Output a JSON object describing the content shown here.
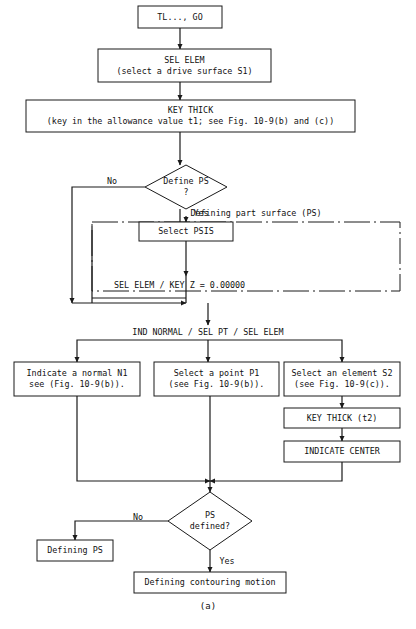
{
  "figure": {
    "caption": "(a)",
    "accent_color": "#1a1a1a",
    "background_color": "#ffffff"
  },
  "chart_data": {
    "type": "diagram",
    "title": "",
    "subtitle": "",
    "caption": "(a)",
    "nodes": [
      {
        "id": "start",
        "shape": "rect",
        "lines": [
          "TL..., GO"
        ],
        "x": 138,
        "y": 6,
        "w": 84,
        "h": 22
      },
      {
        "id": "sel_elem",
        "shape": "rect",
        "lines": [
          "SEL ELEM",
          "(select a drive surface S1)"
        ],
        "x": 98,
        "y": 49,
        "w": 173,
        "h": 33
      },
      {
        "id": "key_thick",
        "shape": "rect",
        "lines": [
          "KEY THICK",
          "(key in the allowance value t1; see Fig. 10-9(b) and (c))"
        ],
        "x": 26,
        "y": 100,
        "w": 329,
        "h": 32
      },
      {
        "id": "define_ps",
        "shape": "diamond",
        "lines": [
          "Define PS",
          "?"
        ],
        "x": 145,
        "y": 165,
        "w": 82,
        "h": 44
      },
      {
        "id": "select_psis",
        "shape": "rect",
        "lines": [
          "Select PSIS"
        ],
        "x": 139,
        "y": 222,
        "w": 94,
        "h": 19
      },
      {
        "id": "ind_normal",
        "shape": "rect",
        "lines": [
          "Indicate a normal N1",
          "see (Fig. 10-9(b))."
        ],
        "x": 14,
        "y": 362,
        "w": 126,
        "h": 34
      },
      {
        "id": "select_point",
        "shape": "rect",
        "lines": [
          "Select a point P1",
          "(see Fig. 10-9(b))."
        ],
        "x": 154,
        "y": 362,
        "w": 125,
        "h": 34
      },
      {
        "id": "select_elem",
        "shape": "rect",
        "lines": [
          "Select an element S2",
          "(see Fig. 10-9(c))."
        ],
        "x": 284,
        "y": 362,
        "w": 116,
        "h": 34
      },
      {
        "id": "key_thick_t2",
        "shape": "rect",
        "lines": [
          "KEY THICK (t2)"
        ],
        "x": 284,
        "y": 408,
        "w": 116,
        "h": 20
      },
      {
        "id": "indicate_ctr",
        "shape": "rect",
        "lines": [
          "INDICATE CENTER"
        ],
        "x": 284,
        "y": 441,
        "w": 116,
        "h": 21
      },
      {
        "id": "ps_defined",
        "shape": "diamond",
        "lines": [
          "PS",
          "defined?"
        ],
        "x": 168,
        "y": 492,
        "w": 84,
        "h": 58
      },
      {
        "id": "defining_ps",
        "shape": "rect",
        "lines": [
          "Defining PS"
        ],
        "x": 37,
        "y": 540,
        "w": 76,
        "h": 21
      },
      {
        "id": "defining_cm",
        "shape": "rect",
        "lines": [
          "Defining contouring motion"
        ],
        "x": 134,
        "y": 572,
        "w": 152,
        "h": 21
      }
    ],
    "groups": [
      {
        "id": "ps_group",
        "label": "Defining part surface (PS)",
        "x": 92,
        "y": 222,
        "w": 308,
        "h": 69,
        "label_x": 256,
        "label_y": 213
      }
    ],
    "free_labels": [
      {
        "id": "sel_elem_key_z",
        "text": "SEL ELEM / KEY Z = 0.00000",
        "x": 114,
        "y": 285,
        "anchor": "start"
      },
      {
        "id": "ind_normal_hdr",
        "text": "IND NORMAL / SEL PT / SEL ELEM",
        "x": 208,
        "y": 332,
        "anchor": "middle"
      }
    ],
    "edge_labels": [
      {
        "id": "define_ps_no",
        "text": "No",
        "x": 112,
        "y": 181
      },
      {
        "id": "define_ps_yes",
        "text": "Yes",
        "x": 201,
        "y": 213
      },
      {
        "id": "ps_defined_no",
        "text": "No",
        "x": 138,
        "y": 517
      },
      {
        "id": "ps_defined_yes",
        "text": "Yes",
        "x": 227,
        "y": 561
      }
    ],
    "edges": [
      {
        "id": "start-to-sel-elem",
        "path": "M180,28 L180,49",
        "arrow": true
      },
      {
        "id": "sel-elem-to-key-thick",
        "path": "M180,82 L180,100",
        "arrow": true
      },
      {
        "id": "key-thick-to-define-ps",
        "path": "M180,132 L180,165",
        "arrow": true
      },
      {
        "id": "define-ps-no-left",
        "path": "M145,187 L72,187 L72,303",
        "arrow": true
      },
      {
        "id": "define-ps-yes-down",
        "path": "M180,209 L180,222",
        "arrow": false
      },
      {
        "id": "yes-to-select-psis",
        "path": "M186,222 L186,222",
        "arrow": false
      },
      {
        "id": "select-psis-in",
        "path": "M186,216 L186,222",
        "arrow": true
      },
      {
        "id": "select-psis-to-sel-key",
        "path": "M186,241 L186,276",
        "arrow": true
      },
      {
        "id": "inner-loop-left",
        "path": "M186,276 L186,303 M92,226 L92,303",
        "arrow": false
      },
      {
        "id": "loop-join-bottom",
        "path": "M72,303 L186,303",
        "arrow": true
      },
      {
        "id": "inner-join-bottom",
        "path": "M92,298 L186,298",
        "arrow": false
      },
      {
        "id": "down-to-ind-normal-hdr",
        "path": "M208,303 L208,325",
        "arrow": true
      },
      {
        "id": "hdr-to-branch-left",
        "path": "M208,340 L77,340 L77,362",
        "arrow": true
      },
      {
        "id": "hdr-to-branch-mid",
        "path": "M208,340 L208,362",
        "arrow": true
      },
      {
        "id": "hdr-to-branch-right",
        "path": "M208,340 L342,340 L342,362",
        "arrow": true
      },
      {
        "id": "elem-to-key-thick-t2",
        "path": "M342,396 L342,408",
        "arrow": true
      },
      {
        "id": "key-thick-t2-to-ind-ctr",
        "path": "M342,428 L342,441",
        "arrow": true
      },
      {
        "id": "ind-normal-down",
        "path": "M77,396 L77,481 L210,481",
        "arrow": true
      },
      {
        "id": "select-point-down",
        "path": "M210,396 L210,492",
        "arrow": true
      },
      {
        "id": "ind-ctr-down",
        "path": "M342,462 L342,481 L210,481",
        "arrow": true
      },
      {
        "id": "ps-defined-no-left",
        "path": "M168,521 L75,521 L75,540",
        "arrow": true
      },
      {
        "id": "ps-defined-yes-down",
        "path": "M210,550 L210,572",
        "arrow": true
      }
    ]
  }
}
